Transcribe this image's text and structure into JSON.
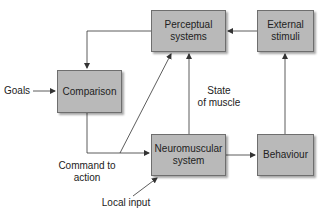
{
  "diagram": {
    "colors": {
      "box_fill": "#b9b9b9",
      "box_border": "#6e6e6e",
      "line": "#333333",
      "text": "#222222"
    },
    "nodes": {
      "perceptual": "Perceptual\nsystems",
      "external": "External\nstimuli",
      "comparison": "Comparison",
      "neuromuscular": "Neuromuscular\nsystem",
      "behaviour": "Behaviour"
    },
    "labels": {
      "goals": "Goals",
      "state_of_muscle": "State\nof muscle",
      "command_to_action": "Command to\naction",
      "local_input": "Local input"
    },
    "edges": [
      {
        "from": "external",
        "to": "perceptual"
      },
      {
        "from": "perceptual",
        "to": "comparison"
      },
      {
        "from": "goals",
        "to": "comparison"
      },
      {
        "from": "comparison",
        "to": "neuromuscular",
        "label": "Command to action"
      },
      {
        "from": "command_to_action",
        "to": "perceptual"
      },
      {
        "from": "neuromuscular",
        "to": "perceptual",
        "label": "State of muscle"
      },
      {
        "from": "neuromuscular",
        "to": "behaviour"
      },
      {
        "from": "behaviour",
        "to": "external"
      },
      {
        "from": "local_input",
        "to": "neuromuscular"
      }
    ]
  }
}
